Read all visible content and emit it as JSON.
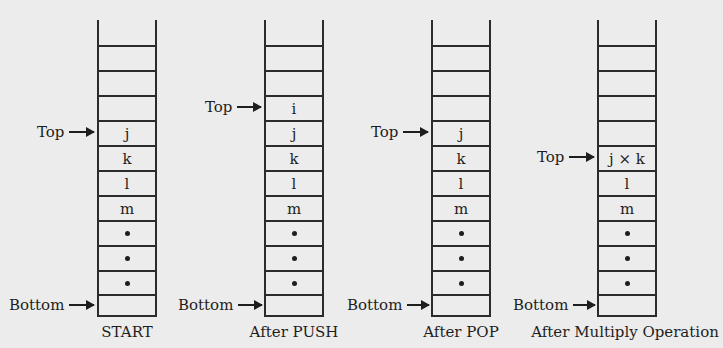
{
  "diagram": {
    "stacks": [
      {
        "caption": "START",
        "cells": [
          "",
          "",
          "",
          "j",
          "k",
          "l",
          "m",
          "•",
          "•",
          "•",
          ""
        ],
        "top_pointer": {
          "label": "Top",
          "row_index": 3
        },
        "bottom_pointer": {
          "label": "Bottom",
          "row_index": 10
        }
      },
      {
        "caption": "After PUSH",
        "cells": [
          "",
          "",
          "i",
          "j",
          "k",
          "l",
          "m",
          "•",
          "•",
          "•",
          ""
        ],
        "top_pointer": {
          "label": "Top",
          "row_index": 2
        },
        "bottom_pointer": {
          "label": "Bottom",
          "row_index": 10
        }
      },
      {
        "caption": "After POP",
        "cells": [
          "",
          "",
          "",
          "j",
          "k",
          "l",
          "m",
          "•",
          "•",
          "•",
          ""
        ],
        "top_pointer": {
          "label": "Top",
          "row_index": 3
        },
        "bottom_pointer": {
          "label": "Bottom",
          "row_index": 10
        }
      },
      {
        "caption": "After Multiply Operation",
        "cells": [
          "",
          "",
          "",
          "",
          "j × k",
          "l",
          "m",
          "•",
          "•",
          "•",
          ""
        ],
        "top_pointer": {
          "label": "Top",
          "row_index": 4
        },
        "bottom_pointer": {
          "label": "Bottom",
          "row_index": 10
        }
      }
    ],
    "colors": {
      "background": "#ececec",
      "lines": "#2b2b2b",
      "text": "#1e1e1e"
    }
  }
}
